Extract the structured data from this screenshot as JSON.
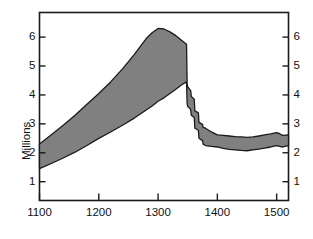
{
  "chart_data": {
    "type": "area",
    "title": "",
    "subtitle": "",
    "xlabel": "",
    "ylabel": "Millions",
    "xlim": [
      1100,
      1520
    ],
    "ylim": [
      0.35,
      6.85
    ],
    "grid": false,
    "legend": null,
    "band_fill_color": "#808080",
    "band_stroke_color": "#1a1a1a",
    "axis_color": "#1a1a1a",
    "background_color": "#ffffff",
    "x_ticks": [
      1100,
      1200,
      1300,
      1400,
      1500
    ],
    "x_tick_labels": [
      "1100",
      "1200",
      "1300",
      "1400",
      "1500"
    ],
    "y_ticks": [
      1,
      2,
      3,
      4,
      5,
      6
    ],
    "y_tick_labels": [
      "1",
      "2",
      "3",
      "4",
      "5",
      "6"
    ],
    "y_ticks_right": [
      1,
      2,
      3,
      4,
      5,
      6
    ],
    "y_tick_labels_right": [
      "1",
      "2",
      "3",
      "4",
      "5",
      "6"
    ],
    "x": [
      1100,
      1120,
      1140,
      1160,
      1180,
      1200,
      1220,
      1240,
      1260,
      1280,
      1290,
      1300,
      1310,
      1320,
      1330,
      1340,
      1348,
      1349,
      1350,
      1355,
      1356,
      1361,
      1362,
      1368,
      1369,
      1375,
      1376,
      1380,
      1390,
      1400,
      1410,
      1420,
      1430,
      1440,
      1450,
      1460,
      1470,
      1480,
      1490,
      1500,
      1505,
      1510,
      1520
    ],
    "series": [
      {
        "name": "High estimate",
        "values": [
          2.3,
          2.62,
          2.95,
          3.3,
          3.68,
          4.05,
          4.45,
          4.9,
          5.4,
          5.95,
          6.15,
          6.3,
          6.28,
          6.18,
          6.05,
          5.88,
          5.75,
          4.4,
          4.28,
          4.15,
          3.95,
          3.85,
          3.45,
          3.38,
          3.05,
          2.98,
          2.88,
          2.85,
          2.72,
          2.62,
          2.6,
          2.58,
          2.56,
          2.55,
          2.53,
          2.55,
          2.58,
          2.62,
          2.65,
          2.7,
          2.66,
          2.6,
          2.62
        ]
      },
      {
        "name": "Low estimate",
        "values": [
          1.45,
          1.63,
          1.82,
          2.02,
          2.25,
          2.5,
          2.72,
          2.95,
          3.2,
          3.48,
          3.62,
          3.78,
          3.9,
          4.05,
          4.2,
          4.35,
          4.45,
          3.72,
          3.6,
          3.5,
          3.3,
          3.22,
          2.85,
          2.78,
          2.5,
          2.42,
          2.3,
          2.25,
          2.22,
          2.2,
          2.15,
          2.12,
          2.1,
          2.08,
          2.07,
          2.1,
          2.13,
          2.16,
          2.2,
          2.25,
          2.22,
          2.2,
          2.25
        ]
      }
    ]
  },
  "axis": {
    "y_title": "Millions"
  }
}
